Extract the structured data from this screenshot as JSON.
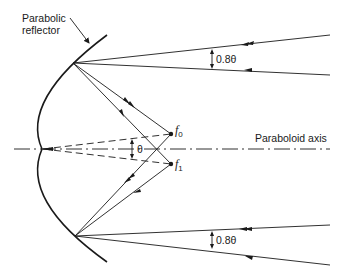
{
  "diagram": {
    "title_label": {
      "line1": "Parabolic",
      "line2": "reflector"
    },
    "axis_label": "Paraboloid axis",
    "focal_points": [
      {
        "name": "f",
        "subscript": "0"
      },
      {
        "name": "f",
        "subscript": "1"
      }
    ],
    "angle_label": "θ",
    "beam_angle_labels": [
      "0.8θ",
      "0.8θ"
    ],
    "colors": {
      "stroke": "#1a1a1a",
      "background": "#ffffff"
    }
  }
}
